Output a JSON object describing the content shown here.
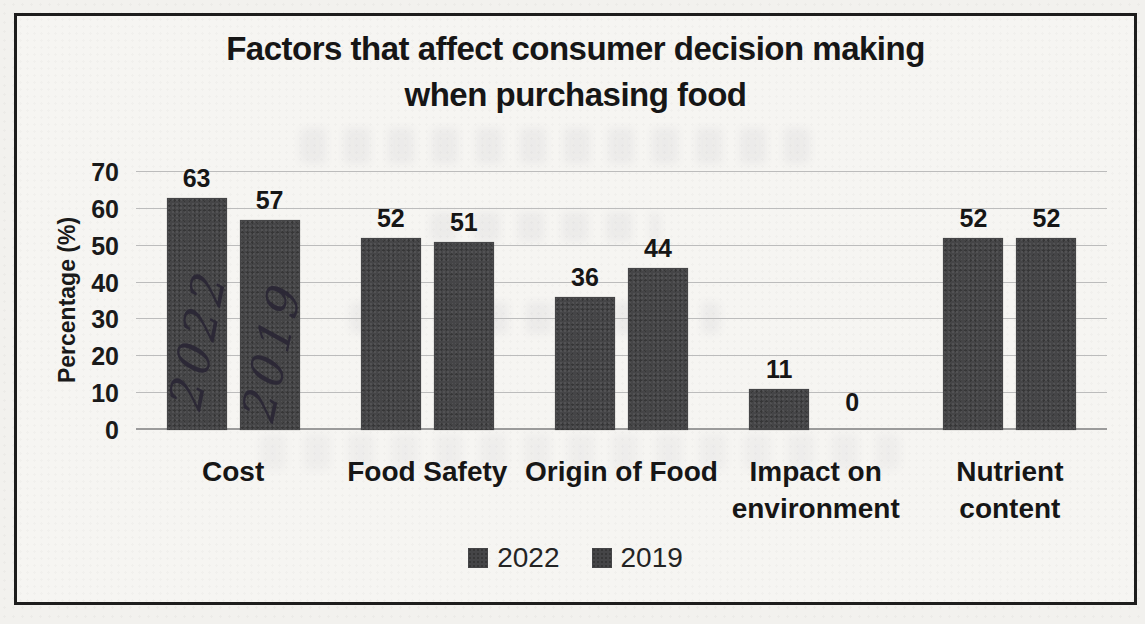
{
  "page": {
    "kind": "scanned bar chart on paper",
    "paper_color": "#f6f5f2",
    "frame_border_color": "#1d1d1d"
  },
  "chart_data": {
    "type": "bar",
    "title": "Factors that affect consumer decision making when purchasing food",
    "title_lines": [
      "Factors that affect consumer decision making",
      "when purchasing food"
    ],
    "xlabel": "",
    "ylabel": "Percentage (%)",
    "ylim": [
      0,
      70
    ],
    "ytick_step": 10,
    "yticks": [
      70,
      60,
      50,
      40,
      30,
      20,
      10,
      0
    ],
    "grid": true,
    "legend_position": "bottom",
    "categories": [
      "Cost",
      "Food Safety",
      "Origin of Food",
      "Impact on environment",
      "Nutrient content"
    ],
    "category_label_lines": [
      [
        "Cost"
      ],
      [
        "Food Safety"
      ],
      [
        "Origin of Food"
      ],
      [
        "Impact on",
        "environment"
      ],
      [
        "Nutrient",
        "content"
      ]
    ],
    "series": [
      {
        "name": "2022",
        "values": [
          63,
          52,
          36,
          11,
          52
        ],
        "color": "#454547"
      },
      {
        "name": "2019",
        "values": [
          57,
          51,
          44,
          0,
          52
        ],
        "color": "#454547"
      }
    ],
    "data_labels": {
      "2022": [
        63,
        52,
        36,
        11,
        52
      ],
      "2019": [
        57,
        51,
        44,
        0,
        52
      ]
    }
  },
  "annotations": {
    "ink_color": "#292534",
    "handwritten": [
      {
        "text": "2022",
        "target": "first Cost bar",
        "orientation": "rotated vertical"
      },
      {
        "text": "2019",
        "target": "second Cost bar",
        "orientation": "rotated vertical"
      }
    ]
  },
  "colors": {
    "bar_fill": "#454547",
    "gridline": "#bcbcbc",
    "baseline": "#9b9b9b",
    "text": "#161616"
  }
}
